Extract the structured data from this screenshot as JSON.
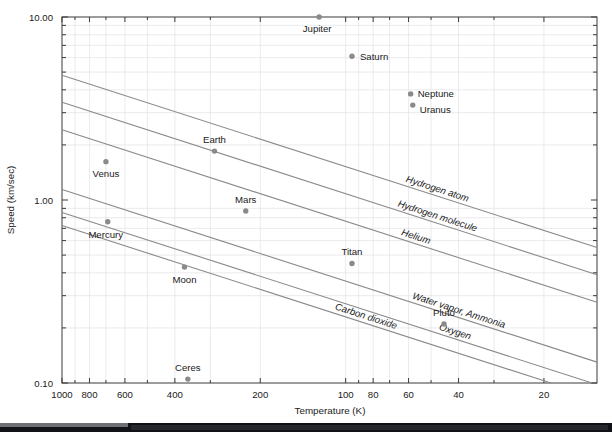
{
  "chart_data": {
    "type": "scatter",
    "title": "",
    "xlabel": "Temperature (K)",
    "ylabel": "Speed (km/sec)",
    "xscale": "log",
    "yscale": "log",
    "x_reversed": true,
    "xlim": [
      1000,
      13
    ],
    "ylim": [
      0.1,
      10.0
    ],
    "grid": true,
    "legend_position": "inline-labels",
    "xticks": [
      {
        "value": 1000,
        "label": "1000"
      },
      {
        "value": 800,
        "label": "800"
      },
      {
        "value": 600,
        "label": "600"
      },
      {
        "value": 400,
        "label": "400"
      },
      {
        "value": 200,
        "label": "200"
      },
      {
        "value": 100,
        "label": "100"
      },
      {
        "value": 80,
        "label": "80"
      },
      {
        "value": 60,
        "label": "60"
      },
      {
        "value": 40,
        "label": "40"
      },
      {
        "value": 20,
        "label": "20"
      }
    ],
    "yticks": [
      {
        "value": 10.0,
        "label": "10.00"
      },
      {
        "value": 1.0,
        "label": "1.00"
      },
      {
        "value": 0.1,
        "label": "0.10"
      }
    ],
    "points": [
      {
        "name": "Jupiter",
        "temperature": 124,
        "speed": 10.0,
        "label_dx": -2,
        "label_dy": 15,
        "anchor": "middle"
      },
      {
        "name": "Saturn",
        "temperature": 95,
        "speed": 6.1,
        "label_dx": 8,
        "label_dy": 4,
        "anchor": "start"
      },
      {
        "name": "Neptune",
        "temperature": 59,
        "speed": 3.8,
        "label_dx": 7,
        "label_dy": 3,
        "anchor": "start"
      },
      {
        "name": "Uranus",
        "temperature": 58,
        "speed": 3.3,
        "label_dx": 7,
        "label_dy": 8,
        "anchor": "start"
      },
      {
        "name": "Earth",
        "temperature": 290,
        "speed": 1.85,
        "label_dx": 0,
        "label_dy": -8,
        "anchor": "middle"
      },
      {
        "name": "Venus",
        "temperature": 700,
        "speed": 1.62,
        "label_dx": 0,
        "label_dy": 15,
        "anchor": "middle"
      },
      {
        "name": "Mars",
        "temperature": 225,
        "speed": 0.87,
        "label_dx": 0,
        "label_dy": -8,
        "anchor": "middle"
      },
      {
        "name": "Mercury",
        "temperature": 690,
        "speed": 0.76,
        "label_dx": -2,
        "label_dy": 16,
        "anchor": "middle"
      },
      {
        "name": "Moon",
        "temperature": 370,
        "speed": 0.43,
        "label_dx": 0,
        "label_dy": 16,
        "anchor": "middle"
      },
      {
        "name": "Titan",
        "temperature": 95,
        "speed": 0.45,
        "label_dx": 0,
        "label_dy": -8,
        "anchor": "middle"
      },
      {
        "name": "Pluto",
        "temperature": 45,
        "speed": 0.21,
        "label_dx": 0,
        "label_dy": -8,
        "anchor": "middle"
      },
      {
        "name": "Ceres",
        "temperature": 360,
        "speed": 0.105,
        "label_dx": 0,
        "label_dy": -8,
        "anchor": "middle"
      }
    ],
    "gas_lines": [
      {
        "name": "Hydrogen atom",
        "x1": 1000,
        "y1": 4.8,
        "x2": 13,
        "y2": 0.55,
        "label_t": 0.7
      },
      {
        "name": "Hydrogen molecule",
        "x1": 1000,
        "y1": 3.42,
        "x2": 13,
        "y2": 0.39,
        "label_t": 0.7
      },
      {
        "name": "Helium",
        "x1": 1000,
        "y1": 2.42,
        "x2": 13,
        "y2": 0.276,
        "label_t": 0.66
      },
      {
        "name": "Water vapor, Ammonia",
        "x1": 1000,
        "y1": 1.14,
        "x2": 13,
        "y2": 0.13,
        "label_t": 0.74
      },
      {
        "name": "Oxygen",
        "x1": 1000,
        "y1": 0.855,
        "x2": 13,
        "y2": 0.098,
        "label_t": 0.74
      },
      {
        "name": "Carbon dioxide",
        "x1": 1000,
        "y1": 0.725,
        "x2": 13,
        "y2": 0.083,
        "label_t": 0.62
      }
    ],
    "point_color": "#8a8a8a",
    "line_color": "#8a8a8a",
    "axis_color": "#3a3a3a",
    "grid_color": "#e2e2e6",
    "background": "#ffffff"
  }
}
